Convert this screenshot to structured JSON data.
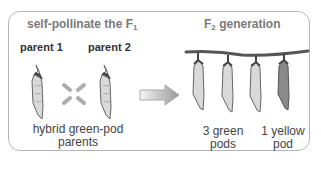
{
  "left_section": {
    "title_prefix": "self-pollinate the F",
    "title_sub": "1",
    "parent1_label": "parent 1",
    "parent2_label": "parent 2",
    "caption_line1": "hybrid green-pod",
    "caption_line2": "parents",
    "cross_symbol": "cross-icon"
  },
  "arrow": {
    "icon": "right-arrow-icon"
  },
  "right_section": {
    "title_prefix": "F",
    "title_sub": "2",
    "title_suffix": " generation",
    "pods": [
      {
        "color": "green",
        "fill": "#d9d9d9"
      },
      {
        "color": "green",
        "fill": "#d9d9d9"
      },
      {
        "color": "green",
        "fill": "#d9d9d9"
      },
      {
        "color": "yellow",
        "fill": "#8a8a8a"
      }
    ],
    "green_caption_line1": "3 green",
    "green_caption_line2": "pods",
    "yellow_caption_line1": "1 yellow",
    "yellow_caption_line2": "pod"
  },
  "colors": {
    "border": "#b5b5b5",
    "title_gray": "#7a7a7a",
    "green_pod": "#d9d9d9",
    "yellow_pod": "#8a8a8a",
    "stem": "#555555"
  }
}
